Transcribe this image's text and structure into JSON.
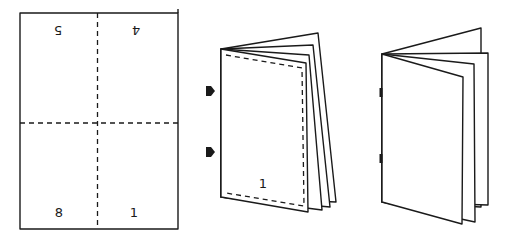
{
  "figure": {
    "colors": {
      "line": "#1a1a1a",
      "background": "#ffffff"
    }
  },
  "sheet": {
    "page_numbers": {
      "top_left": "5",
      "top_right": "4",
      "bottom_left": "8",
      "bottom_right": "1"
    },
    "top_numbers_rotated": true,
    "fold_lines": [
      "vertical-dashed",
      "horizontal-dashed"
    ]
  },
  "folded_booklet": {
    "cover_page_number": "1",
    "staple_arrows": 2,
    "trim_line": "dashed"
  },
  "finished_booklet": {
    "staples": 2
  }
}
